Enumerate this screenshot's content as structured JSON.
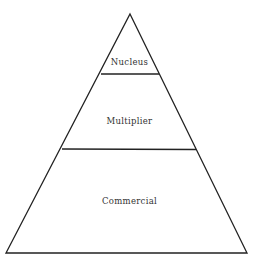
{
  "diagram": {
    "type": "pyramid",
    "stroke_color": "#222222",
    "background": "#ffffff",
    "tiers": [
      {
        "label": "Nucleus",
        "position": "top"
      },
      {
        "label": "Multiplier",
        "position": "middle"
      },
      {
        "label": "Commercial",
        "position": "bottom"
      }
    ]
  }
}
